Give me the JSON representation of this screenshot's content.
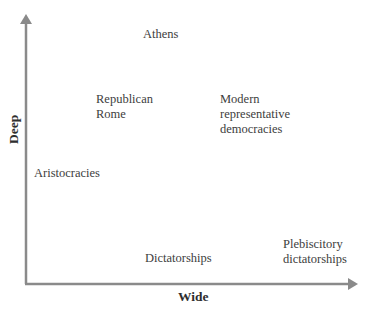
{
  "diagram": {
    "type": "two-axis conceptual plot",
    "axes": {
      "x": {
        "label": "Wide"
      },
      "y": {
        "label": "Deep"
      },
      "color": "#8a8a8a"
    },
    "items": [
      {
        "lines": [
          "Athens"
        ]
      },
      {
        "lines": [
          "Republican",
          "Rome"
        ]
      },
      {
        "lines": [
          "Modern",
          "representative",
          "democracies"
        ]
      },
      {
        "lines": [
          "Aristocracies"
        ]
      },
      {
        "lines": [
          "Dictatorships"
        ]
      },
      {
        "lines": [
          "Plebiscitory",
          "dictatorships"
        ]
      }
    ]
  }
}
